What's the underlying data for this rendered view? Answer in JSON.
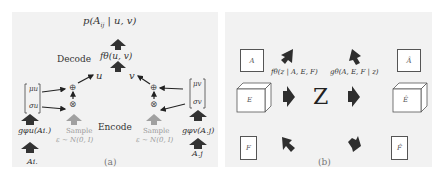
{
  "panel_a": {
    "caption": "(a)",
    "top_label": "p(A_ij | u, v)",
    "top_label_parts": {
      "p": "p(A",
      "sub": "ij",
      "rest": " | u, v)"
    },
    "decode_label": "Decode",
    "decoder_fn": "fθ(u, v)",
    "node_u": "u",
    "node_v": "v",
    "encode_label": "Encode",
    "left": {
      "mu": "μu",
      "sigma": "σu",
      "encoder": "gφu(Ai.)",
      "input": "Ai.",
      "sample_label": "Sample",
      "sample_dist": "ε ∼ N(0, I)"
    },
    "right": {
      "mu": "μv",
      "sigma": "σv",
      "encoder": "gφv(A.j)",
      "input": "A.j",
      "sample_label": "Sample",
      "sample_dist": "ε ∼ N(0, I)"
    },
    "plus_symbol": "⊕",
    "times_symbol": "⊗"
  },
  "panel_b": {
    "caption": "(b)",
    "latent": "Z",
    "encoder_fn": "fθ(z | A, E, F)",
    "decoder_fn": "gθ(A, E, F | z)",
    "inputs": [
      "A",
      "E",
      "F"
    ],
    "outputs": [
      "Â",
      "Ê",
      "F̂"
    ]
  },
  "colors": {
    "panel_bg": "#f2f2f2",
    "arrow_dark": "#333333",
    "arrow_light": "#a0a0a0",
    "text_gray": "#9a9a9a"
  }
}
